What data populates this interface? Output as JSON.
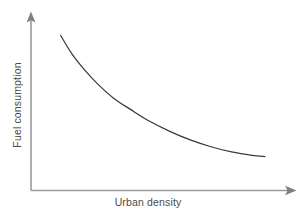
{
  "chart_data": {
    "type": "line",
    "title": "",
    "subtitle": "",
    "xlabel": "Urban density",
    "ylabel": "Fuel consumption",
    "grid": false,
    "legend": false,
    "legend_position": "none",
    "axis_style": "arrow-headed open axes, no tick marks, no tick labels",
    "xlim": [
      0,
      1
    ],
    "ylim": [
      0,
      1
    ],
    "xticks": [],
    "yticks": [],
    "xticklabels": [],
    "yticklabels": [],
    "annotations": [],
    "series": [
      {
        "name": "Fuel consumption vs urban density",
        "relationship": "decreasing hyperbolic decay, steep at low density, asymptotically flat at high density",
        "x": [
          0.115,
          0.16,
          0.21,
          0.26,
          0.32,
          0.39,
          0.46,
          0.54,
          0.62,
          0.7,
          0.78,
          0.86,
          0.91
        ],
        "y": [
          0.905,
          0.795,
          0.7,
          0.62,
          0.54,
          0.47,
          0.405,
          0.345,
          0.295,
          0.255,
          0.225,
          0.205,
          0.198
        ]
      }
    ]
  },
  "colors": {
    "background": "#ffffff",
    "axis": "#9a9a9a",
    "arrowhead": "#7f7f7f",
    "curve": "#3a3a3a",
    "label_text": "#4a4a4a"
  },
  "icons": {
    "x_axis_arrow": "arrow-right-icon",
    "y_axis_arrow": "arrow-up-icon"
  }
}
